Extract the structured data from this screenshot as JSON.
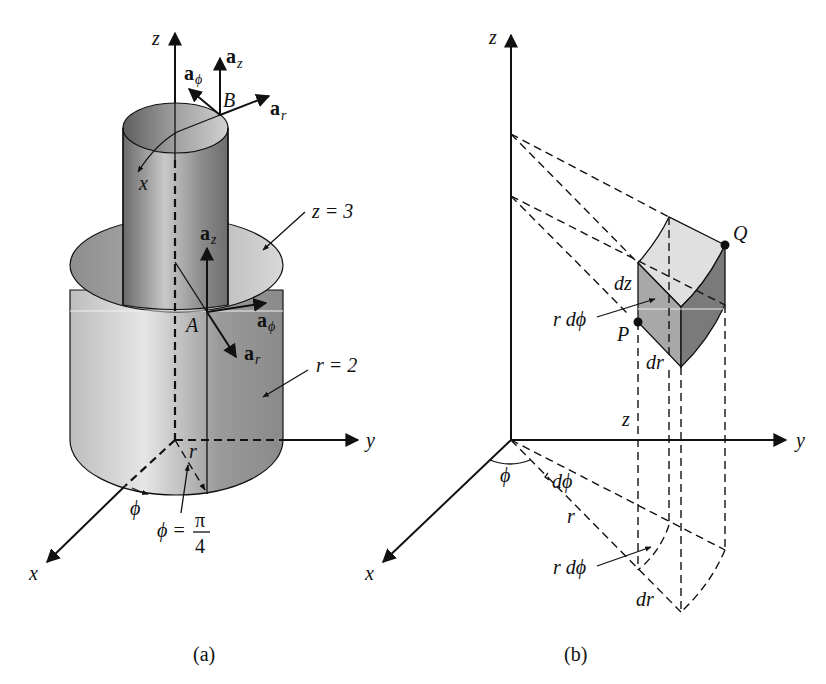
{
  "figure_a": {
    "caption": "(a)",
    "axes": {
      "z": "z",
      "y": "y",
      "x": "x"
    },
    "point_B": "B",
    "point_A": "A",
    "vectors_B": {
      "a_z": {
        "base": "a",
        "sub": "z"
      },
      "a_phi": {
        "base": "a",
        "sub": "ϕ"
      },
      "a_r": {
        "base": "a",
        "sub": "r"
      }
    },
    "vectors_A": {
      "a_z": {
        "base": "a",
        "sub": "z"
      },
      "a_phi": {
        "base": "a",
        "sub": "ϕ"
      },
      "a_r": {
        "base": "a",
        "sub": "r"
      }
    },
    "inner_x_label": "x",
    "surface_plane": "z = 3",
    "surface_cylinder": "r = 2",
    "phi_label": "ϕ",
    "r_label": "r",
    "phi_eq": {
      "lhs": "ϕ =",
      "num": "π",
      "den": "4"
    }
  },
  "figure_b": {
    "caption": "(b)",
    "axes": {
      "z": "z",
      "y": "y",
      "x": "x"
    },
    "point_P": "P",
    "point_Q": "Q",
    "dz_label": "dz",
    "r_dphi_top": "r dϕ",
    "dr_top": "dr",
    "z_label": "z",
    "phi_label": "ϕ",
    "dphi_label": "dϕ",
    "r_label": "r",
    "r_dphi_bottom": "r dϕ",
    "dr_bottom": "dr"
  },
  "colors": {
    "ink": "#111111",
    "shade_light": "#e2e2e2",
    "shade_mid": "#a8a8a8",
    "shade_dark": "#6e6e6e"
  }
}
